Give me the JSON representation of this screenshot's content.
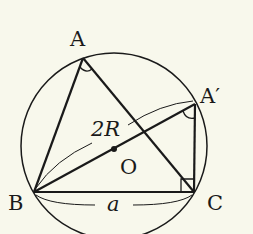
{
  "diagram": {
    "colors": {
      "background": "#f8f8ec",
      "stroke": "#1a1a1a"
    },
    "points": {
      "A": {
        "label": "A",
        "x": 83,
        "y": 58
      },
      "A_prime": {
        "label": "A′",
        "x": 195,
        "y": 104
      },
      "B": {
        "label": "B",
        "x": 34,
        "y": 192
      },
      "C": {
        "label": "C",
        "x": 194,
        "y": 192
      },
      "O": {
        "label": "O",
        "x": 114,
        "y": 149
      }
    },
    "circle": {
      "cx": 114,
      "cy": 146,
      "r": 93
    },
    "labels": {
      "diameter": "2R",
      "side_a": "a"
    },
    "segments": [
      "AB",
      "AC",
      "BC",
      "BA′",
      "A′C"
    ],
    "angle_marks": [
      "angle A",
      "angle A′"
    ],
    "right_angle": "C"
  }
}
